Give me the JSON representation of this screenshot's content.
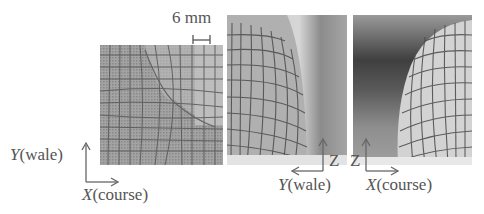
{
  "figure": {
    "scale_bar": {
      "label": "6 mm"
    },
    "panels": [
      {
        "id": "top-view",
        "description": "Flat knit fabric grid, deformed around a corner"
      },
      {
        "id": "side-view-wale",
        "description": "Domed knit fabric grid viewed along wale axis"
      },
      {
        "id": "side-view-course",
        "description": "Domed knit fabric grid viewed along course axis"
      }
    ],
    "axes": {
      "panel1": {
        "y_var": "Y",
        "y_label": "(wale)",
        "x_var": "X",
        "x_label": "(course)"
      },
      "panel2": {
        "up_var": "Z",
        "left_var": "Y",
        "left_label": "(wale)"
      },
      "panel3": {
        "up_var": "Z",
        "right_var": "X",
        "right_label": "(course)"
      }
    }
  }
}
